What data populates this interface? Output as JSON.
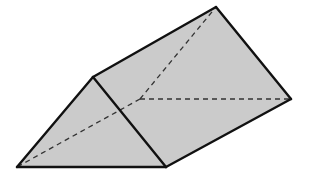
{
  "diagram": {
    "type": "triangular-prism",
    "colors": {
      "face_fill": "#cbcbcb",
      "edge": "#111111",
      "hidden_edge": "#333333",
      "background": "#ffffff"
    },
    "vertices": {
      "front_left": [
        17,
        167
      ],
      "front_top": [
        93,
        77
      ],
      "front_right": [
        166,
        167
      ],
      "back_top": [
        216,
        7
      ],
      "back_right": [
        291,
        99
      ],
      "back_left_hidden": [
        140,
        99
      ]
    },
    "faces": [
      {
        "name": "front-triangle-face",
        "points": [
          "front_left",
          "front_top",
          "front_right"
        ]
      },
      {
        "name": "top-rectangle-face",
        "points": [
          "front_top",
          "back_top",
          "back_right",
          "front_right"
        ]
      }
    ],
    "solid_edges": [
      [
        "front_left",
        "front_top"
      ],
      [
        "front_top",
        "front_right"
      ],
      [
        "front_right",
        "front_left"
      ],
      [
        "front_top",
        "back_top"
      ],
      [
        "back_top",
        "back_right"
      ],
      [
        "back_right",
        "front_right"
      ]
    ],
    "hidden_edges": [
      [
        "back_left_hidden",
        "front_left"
      ],
      [
        "back_left_hidden",
        "back_top"
      ],
      [
        "back_left_hidden",
        "back_right"
      ]
    ]
  }
}
